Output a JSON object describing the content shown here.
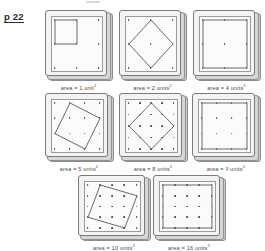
{
  "page": {
    "label": "p 22",
    "topic": "squares on dot-grid geoboards"
  },
  "caption_prefix": "area = ",
  "caption_unit_singular": "unit",
  "caption_unit_plural": "units",
  "caption_exponent": "2",
  "panels": [
    {
      "id": "panel-area-1",
      "area": "1",
      "unit": "unit",
      "caption": "area = 1 unit²",
      "grid": 3,
      "handwritten": false,
      "polygon": [
        [
          0,
          0
        ],
        [
          1,
          0
        ],
        [
          1,
          1
        ],
        [
          0,
          1
        ]
      ]
    },
    {
      "id": "panel-area-2",
      "area": "2",
      "unit": "units",
      "caption": "area = 2 units²",
      "grid": 3,
      "handwritten": false,
      "polygon": [
        [
          1,
          0
        ],
        [
          2,
          1
        ],
        [
          1,
          2
        ],
        [
          0,
          1
        ]
      ]
    },
    {
      "id": "panel-area-4",
      "area": "4",
      "unit": "units",
      "caption": "area = 4 units²",
      "grid": 3,
      "handwritten": false,
      "polygon": [
        [
          0,
          0
        ],
        [
          2,
          0
        ],
        [
          2,
          2
        ],
        [
          0,
          2
        ]
      ]
    },
    {
      "id": "panel-area-5",
      "area": "5",
      "unit": "units",
      "caption": "area = 5 units²",
      "grid": 4,
      "handwritten": false,
      "polygon": [
        [
          1,
          0
        ],
        [
          3,
          1
        ],
        [
          2,
          3
        ],
        [
          0,
          2
        ]
      ]
    },
    {
      "id": "panel-area-8",
      "area": "8",
      "unit": "units",
      "caption": "area = 8 units²",
      "grid": 5,
      "handwritten": false,
      "polygon": [
        [
          2,
          0
        ],
        [
          4,
          2
        ],
        [
          2,
          4
        ],
        [
          0,
          2
        ]
      ]
    },
    {
      "id": "panel-area-9",
      "area": "9",
      "unit": "units",
      "caption": "area = 9 units²",
      "grid": 4,
      "handwritten": true,
      "polygon": [
        [
          0,
          0
        ],
        [
          3,
          0
        ],
        [
          3,
          3
        ],
        [
          0,
          3
        ]
      ]
    },
    {
      "id": "panel-area-10",
      "area": "10",
      "unit": "units",
      "caption": "area = 10 units²",
      "grid": 5,
      "handwritten": false,
      "polygon": [
        [
          1,
          0
        ],
        [
          4,
          1
        ],
        [
          3,
          4
        ],
        [
          0,
          3
        ]
      ]
    },
    {
      "id": "panel-area-16",
      "area": "16",
      "unit": "units",
      "caption": "area = 16 units²",
      "grid": 5,
      "handwritten": false,
      "polygon": [
        [
          0,
          0
        ],
        [
          4,
          0
        ],
        [
          4,
          4
        ],
        [
          0,
          4
        ]
      ]
    }
  ]
}
